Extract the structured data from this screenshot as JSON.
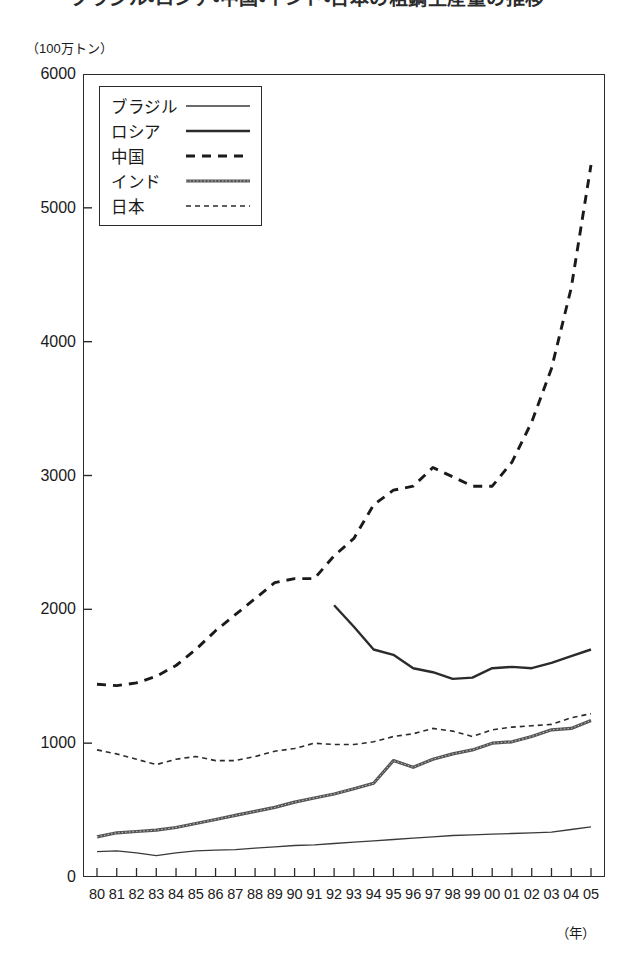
{
  "title": {
    "number": "1",
    "text": "ブラジル・ロシア・中国・インド・日本の粗鋼生産量の推移"
  },
  "axis": {
    "y_unit_label": "（100万トン）",
    "x_unit_label": "（年）",
    "y_ticks": [
      "0",
      "1000",
      "2000",
      "3000",
      "4000",
      "5000",
      "6000"
    ],
    "x_ticks": [
      "80",
      "81",
      "82",
      "83",
      "84",
      "85",
      "86",
      "87",
      "88",
      "89",
      "90",
      "91",
      "92",
      "93",
      "94",
      "95",
      "96",
      "97",
      "98",
      "99",
      "00",
      "01",
      "02",
      "03",
      "04",
      "05"
    ]
  },
  "legend": {
    "items": [
      {
        "label": "ブラジル",
        "style": "thin-solid",
        "color": "#3a3a3a"
      },
      {
        "label": "ロシア",
        "style": "thick-solid",
        "color": "#2b2b2b"
      },
      {
        "label": "中国",
        "style": "thick-dashed",
        "color": "#1a1a1a"
      },
      {
        "label": "インド",
        "style": "textured",
        "color": "#555555"
      },
      {
        "label": "日本",
        "style": "fine-dotted",
        "color": "#2b2b2b"
      }
    ]
  },
  "chart_data": {
    "type": "line",
    "title": "ブラジル・ロシア・中国・インド・日本の粗鋼生産量の推移",
    "xlabel": "（年）",
    "ylabel": "（100万トン）",
    "xlim": [
      1980,
      2005
    ],
    "ylim": [
      0,
      6000
    ],
    "y_tick_interval": 1000,
    "grid": false,
    "legend_position": "top-left-inside",
    "x": [
      1980,
      1981,
      1982,
      1983,
      1984,
      1985,
      1986,
      1987,
      1988,
      1989,
      1990,
      1991,
      1992,
      1993,
      1994,
      1995,
      1996,
      1997,
      1998,
      1999,
      2000,
      2001,
      2002,
      2003,
      2004,
      2005
    ],
    "series": [
      {
        "name": "ブラジル",
        "line_style": "thin-solid",
        "values": [
          190,
          195,
          180,
          160,
          180,
          195,
          200,
          205,
          215,
          225,
          235,
          240,
          250,
          260,
          270,
          280,
          290,
          300,
          310,
          315,
          320,
          325,
          330,
          335,
          355,
          375
        ]
      },
      {
        "name": "ロシア",
        "line_style": "thick-solid",
        "start_year": 1992,
        "values": [
          null,
          null,
          null,
          null,
          null,
          null,
          null,
          null,
          null,
          null,
          null,
          null,
          2030,
          1870,
          1700,
          1660,
          1560,
          1530,
          1480,
          1490,
          1560,
          1570,
          1560,
          1600,
          1650,
          1700
        ]
      },
      {
        "name": "中国",
        "line_style": "thick-dashed",
        "values": [
          1440,
          1430,
          1450,
          1500,
          1580,
          1700,
          1840,
          1960,
          2080,
          2200,
          2230,
          2230,
          2400,
          2530,
          2780,
          2890,
          2920,
          3060,
          2990,
          2920,
          2920,
          3100,
          3400,
          3800,
          4400,
          5320
        ]
      },
      {
        "name": "インド",
        "line_style": "textured",
        "values": [
          300,
          330,
          340,
          350,
          370,
          400,
          430,
          460,
          490,
          520,
          560,
          590,
          620,
          660,
          700,
          870,
          820,
          880,
          920,
          950,
          1000,
          1010,
          1050,
          1100,
          1110,
          1170
        ]
      },
      {
        "name": "日本",
        "line_style": "fine-dotted",
        "values": [
          950,
          920,
          880,
          840,
          880,
          900,
          870,
          870,
          900,
          940,
          960,
          1000,
          990,
          990,
          1010,
          1050,
          1070,
          1110,
          1090,
          1050,
          1100,
          1120,
          1130,
          1140,
          1190,
          1220
        ]
      }
    ]
  }
}
